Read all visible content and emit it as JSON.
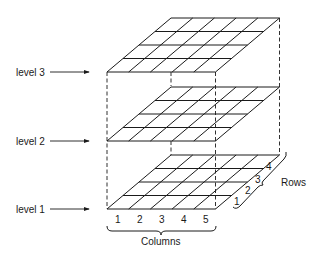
{
  "diagram": {
    "type": "3d-stacked-grid",
    "levels": [
      {
        "label": "level 3",
        "y_front": 72
      },
      {
        "label": "level 2",
        "y_front": 141
      },
      {
        "label": "level 1",
        "y_front": 209
      }
    ],
    "columns": {
      "title": "Columns",
      "labels": [
        "1",
        "2",
        "3",
        "4",
        "5"
      ]
    },
    "rows": {
      "title": "Rows",
      "labels": [
        "1",
        "2",
        "3",
        "4"
      ]
    },
    "grid": {
      "columns": 5,
      "rows": 4
    },
    "colors": {
      "ink": "#1a1a1a",
      "background": "#ffffff"
    }
  }
}
